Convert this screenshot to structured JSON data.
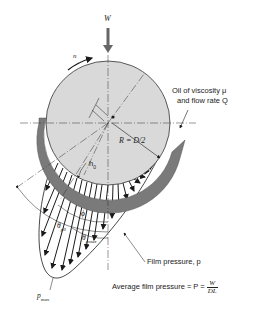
{
  "diagram": {
    "colors": {
      "journal_fill": "#d9d9d9",
      "bearing_shell": "#7a7a7a",
      "lines": "#1a1a1a",
      "load_arrow": "#666666"
    },
    "labels": {
      "load": "W",
      "rotation": "n",
      "oil_line1": "Oil of viscosity μ",
      "oil_line2": "and flow rate Q",
      "radius": "R = D/2",
      "min_film": "h",
      "min_film_sub": "0",
      "phi": "ϕ",
      "theta_p0": "θ",
      "theta_p0_sub": "p0",
      "theta_pmax": "θ",
      "theta_pmax_sub": "pmax",
      "film_pressure": "Film pressure, p",
      "avg_pressure_text": "Average film pressure = P =",
      "avg_num": "W",
      "avg_den": "DL",
      "p_max": "p",
      "p_max_sub": "max"
    }
  }
}
